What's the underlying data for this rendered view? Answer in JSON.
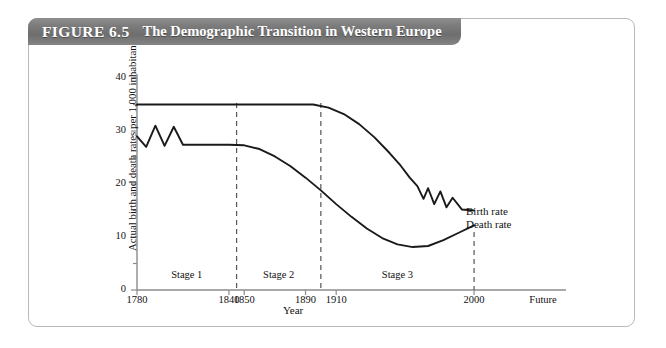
{
  "figure": {
    "number": "FIGURE 6.5",
    "title": "The Demographic Transition in Western Europe"
  },
  "chart_data": {
    "type": "line",
    "title": "The Demographic Transition in Western Europe",
    "xlabel": "Year",
    "ylabel": "Actual birth and death rates per 1,000 inhabitants",
    "ylim": [
      0,
      42
    ],
    "yticks": [
      0,
      10,
      20,
      30,
      40
    ],
    "ytick_labels": [
      "0",
      "10",
      "20",
      "30",
      "40"
    ],
    "yminor_ticks": [
      5,
      15,
      25,
      35
    ],
    "xlim": [
      1780,
      2060
    ],
    "xtick_labels": [
      "1780",
      "1840",
      "1850",
      "1890",
      "1910",
      "2000",
      "Future"
    ],
    "xtick_values": [
      1780,
      1840,
      1850,
      1890,
      1910,
      2000,
      2045
    ],
    "grid": false,
    "legend": "inline-right",
    "stage_dividers": [
      1845,
      1900,
      2000
    ],
    "stages": [
      {
        "label": "Stage 1",
        "start": 1780,
        "end": 1845
      },
      {
        "label": "Stage 2",
        "start": 1845,
        "end": 1900
      },
      {
        "label": "Stage 3",
        "start": 1900,
        "end": 2000
      }
    ],
    "series": [
      {
        "name": "Birth rate",
        "label": "Birth rate",
        "color": "#1a1a1a",
        "points": [
          [
            1780,
            35
          ],
          [
            1800,
            35
          ],
          [
            1820,
            35
          ],
          [
            1840,
            35
          ],
          [
            1860,
            35
          ],
          [
            1880,
            35
          ],
          [
            1895,
            35
          ],
          [
            1905,
            34.4
          ],
          [
            1915,
            33.2
          ],
          [
            1925,
            31.3
          ],
          [
            1935,
            28.8
          ],
          [
            1945,
            25.8
          ],
          [
            1952,
            23.5
          ],
          [
            1958,
            21.2
          ],
          [
            1963,
            19.6
          ],
          [
            1967,
            17.2
          ],
          [
            1970,
            19.2
          ],
          [
            1974,
            16.2
          ],
          [
            1978,
            18.6
          ],
          [
            1982,
            15.6
          ],
          [
            1986,
            17.4
          ],
          [
            1992,
            15.2
          ],
          [
            2000,
            15.0
          ]
        ]
      },
      {
        "name": "Death rate",
        "label": "Death rate",
        "color": "#1a1a1a",
        "points": [
          [
            1780,
            29.0
          ],
          [
            1786,
            27.0
          ],
          [
            1792,
            31.0
          ],
          [
            1798,
            27.2
          ],
          [
            1804,
            30.8
          ],
          [
            1810,
            27.4
          ],
          [
            1840,
            27.4
          ],
          [
            1850,
            27.3
          ],
          [
            1860,
            26.6
          ],
          [
            1870,
            25.2
          ],
          [
            1880,
            23.4
          ],
          [
            1890,
            21.2
          ],
          [
            1900,
            18.8
          ],
          [
            1910,
            16.2
          ],
          [
            1920,
            13.8
          ],
          [
            1930,
            11.6
          ],
          [
            1940,
            9.8
          ],
          [
            1950,
            8.6
          ],
          [
            1960,
            8.1
          ],
          [
            1970,
            8.3
          ],
          [
            1980,
            9.4
          ],
          [
            1990,
            10.8
          ],
          [
            2000,
            12.2
          ]
        ]
      }
    ]
  }
}
